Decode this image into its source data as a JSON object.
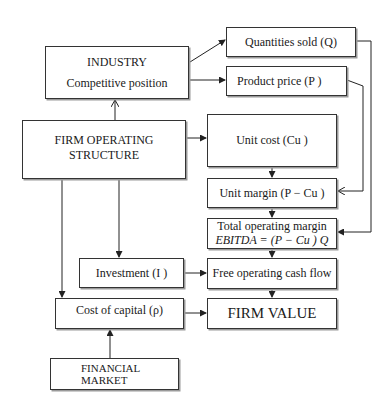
{
  "diagram": {
    "type": "flowchart",
    "nodes": {
      "industry": {
        "line1": "INDUSTRY",
        "line2": "Competitive position"
      },
      "firm_structure": {
        "line1": "FIRM OPERATING",
        "line2": "STRUCTURE"
      },
      "quantities": {
        "label": "Quantities sold (Q)"
      },
      "price": {
        "label": "Product price (P )"
      },
      "unit_cost": {
        "label": "Unit cost (Cu )"
      },
      "unit_margin": {
        "label": "Unit margin (P  − Cu )"
      },
      "total_margin": {
        "line1": "Total operating margin",
        "line2": "EBITDA = (P  − Cu ) Q"
      },
      "investment": {
        "label": "Investment (I )"
      },
      "fcf": {
        "label": "Free operating cash flow"
      },
      "cost_capital": {
        "label": "Cost of capital (ρ)"
      },
      "firm_value": {
        "label": "FIRM VALUE"
      },
      "financial_market": {
        "line1": "FINANCIAL",
        "line2": "MARKET"
      }
    },
    "edges": [
      {
        "from": "firm_structure",
        "to": "industry"
      },
      {
        "from": "industry",
        "to": "quantities"
      },
      {
        "from": "industry",
        "to": "price"
      },
      {
        "from": "firm_structure",
        "to": "unit_cost"
      },
      {
        "from": "unit_cost",
        "to": "unit_margin"
      },
      {
        "from": "price",
        "to": "unit_margin"
      },
      {
        "from": "unit_margin",
        "to": "total_margin"
      },
      {
        "from": "quantities",
        "to": "total_margin"
      },
      {
        "from": "total_margin",
        "to": "fcf"
      },
      {
        "from": "firm_structure",
        "to": "investment"
      },
      {
        "from": "investment",
        "to": "fcf"
      },
      {
        "from": "fcf",
        "to": "firm_value"
      },
      {
        "from": "firm_structure",
        "to": "cost_capital"
      },
      {
        "from": "financial_market",
        "to": "cost_capital"
      },
      {
        "from": "cost_capital",
        "to": "firm_value"
      }
    ]
  }
}
